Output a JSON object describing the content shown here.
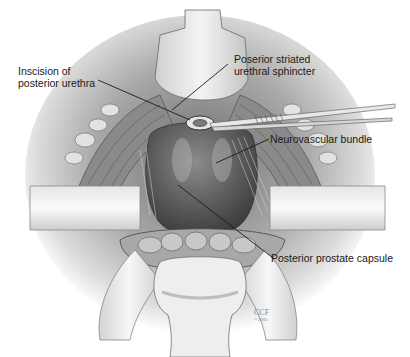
{
  "figure": {
    "labels": [
      {
        "id": "incision",
        "line1": "Inscision of",
        "line2": "posterior urethra"
      },
      {
        "id": "sphincter",
        "line1": "Poserior striated",
        "line2": "urethral sphincter"
      },
      {
        "id": "nvb",
        "line1": "Neurovascular bundle"
      },
      {
        "id": "capsule",
        "line1": "Posterior prostate capsule"
      }
    ],
    "watermark": {
      "line1": "CCF",
      "line2": "©2005"
    }
  },
  "colors": {
    "background": "#ffffff",
    "tissue_dark": "#5a5a5a",
    "tissue_mid": "#9a9a9a",
    "tissue_light": "#d8d8d8",
    "leader_line": "#1a1a1a"
  }
}
